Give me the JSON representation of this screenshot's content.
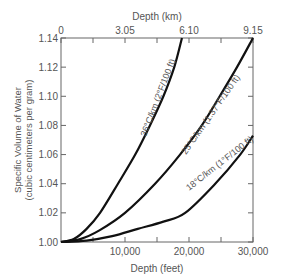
{
  "chart_data": {
    "type": "line",
    "title": "",
    "xlabel": "Depth (feet)",
    "x2label": "Depth (km)",
    "ylabel": "Specific Volume of Water",
    "ylabel_sub": "(cubic centimeters per gram)",
    "xlim": [
      0,
      30000
    ],
    "ylim": [
      1.0,
      1.14
    ],
    "grid": false,
    "x_ticks": [
      {
        "value": 10000,
        "label": "10,000"
      },
      {
        "value": 20000,
        "label": "20,000"
      },
      {
        "value": 30000,
        "label": "30,000"
      }
    ],
    "x_minor_ticks": [
      5000,
      15000,
      25000
    ],
    "x2_ticks": [
      {
        "value": 0,
        "label": "0"
      },
      {
        "value": 10000,
        "label": "3.05"
      },
      {
        "value": 20000,
        "label": "6.10"
      },
      {
        "value": 30000,
        "label": "9.15"
      }
    ],
    "x2_minor_ticks": [
      5000,
      15000,
      25000
    ],
    "y_ticks": [
      {
        "value": 1.0,
        "label": "1.00"
      },
      {
        "value": 1.02,
        "label": "1.02"
      },
      {
        "value": 1.04,
        "label": "1.04"
      },
      {
        "value": 1.06,
        "label": "1.06"
      },
      {
        "value": 1.08,
        "label": "1.08"
      },
      {
        "value": 1.1,
        "label": "1.10"
      },
      {
        "value": 1.12,
        "label": "1.12"
      },
      {
        "value": 1.14,
        "label": "1.14"
      }
    ],
    "series": [
      {
        "name": "36°C/km (2°F/100 ft)",
        "x": [
          0,
          2000,
          4000,
          6100,
          8900,
          11600,
          13900,
          16000,
          17700,
          18900
        ],
        "y": [
          1.0,
          1.002,
          1.009,
          1.02,
          1.04,
          1.06,
          1.08,
          1.1,
          1.12,
          1.14
        ]
      },
      {
        "name": "25°C/km (1.37°F/100 ft)",
        "x": [
          0,
          3000,
          6000,
          10000,
          14700,
          18600,
          22000,
          24800,
          27500,
          30000
        ],
        "y": [
          1.0,
          1.002,
          1.008,
          1.02,
          1.04,
          1.06,
          1.08,
          1.1,
          1.12,
          1.14
        ]
      },
      {
        "name": "18°C/km (1°F/100 ft)",
        "x": [
          0,
          4000,
          8000,
          12000,
          16000,
          19400,
          24100,
          28000,
          30000
        ],
        "y": [
          1.0,
          1.001,
          1.004,
          1.009,
          1.014,
          1.02,
          1.04,
          1.06,
          1.073
        ]
      }
    ],
    "annotations": [
      {
        "text": "36°C/km (2°F/100 ft)",
        "series": 0
      },
      {
        "text": "25°C/km (1.37°F/100 ft)",
        "series": 1
      },
      {
        "text": "18°C/km (1°F/100 ft)",
        "series": 2
      }
    ]
  }
}
